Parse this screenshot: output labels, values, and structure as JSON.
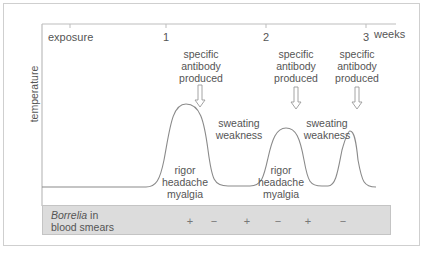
{
  "diagram": {
    "y_axis_label": "temperature",
    "x_axis_unit": "weeks",
    "x_ticks": [
      {
        "label": "exposure",
        "x": 70
      },
      {
        "label": "1",
        "x": 166
      },
      {
        "label": "2",
        "x": 266
      },
      {
        "label": "3",
        "x": 366
      }
    ],
    "antibody_annotations": [
      {
        "line1": "specific",
        "line2": "antibody",
        "line3": "produced"
      },
      {
        "line1": "specific",
        "line2": "antibody",
        "line3": "produced"
      },
      {
        "line1": "specific",
        "line2": "antibody",
        "line3": "produced"
      }
    ],
    "peak_symptoms": [
      {
        "line1": "rigor",
        "line2": "headache",
        "line3": "myalgia"
      },
      {
        "line1": "rigor",
        "line2": "headache",
        "line3": "myalgia"
      }
    ],
    "trough_symptoms": [
      {
        "line1": "sweating",
        "line2": "weakness"
      },
      {
        "line1": "sweating",
        "line2": "weakness"
      }
    ],
    "blood_smear_row": {
      "title_italic": "Borrelia",
      "title_rest": " in",
      "title_line2": "blood smears",
      "signs": [
        "+",
        "−",
        "+",
        "−",
        "+",
        "−"
      ]
    },
    "colors": {
      "line": "#8a8a8a",
      "band": "#dcdcdc",
      "text": "#555555"
    }
  }
}
